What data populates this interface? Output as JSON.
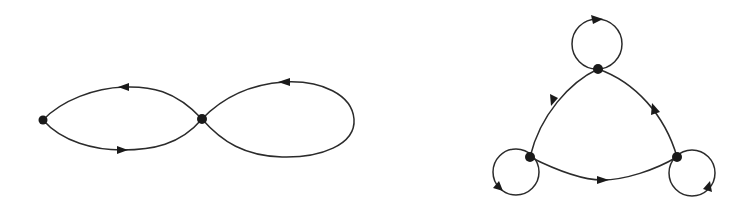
{
  "diagram": {
    "type": "directed-graph-figures",
    "colors": {
      "background": "#ffffff",
      "stroke": "#2b2b2b",
      "node": "#1a1a1a"
    },
    "figures": [
      {
        "name": "figure-eight-graph",
        "nodes": [
          {
            "id": "A",
            "x": 43,
            "y": 120
          },
          {
            "id": "B",
            "x": 202,
            "y": 119
          }
        ],
        "edges": [
          {
            "from": "B",
            "to": "A",
            "kind": "arc-upper"
          },
          {
            "from": "A",
            "to": "B",
            "kind": "arc-lower"
          },
          {
            "from": "B",
            "to": "B",
            "kind": "loop-right"
          }
        ]
      },
      {
        "name": "triangle-graph-with-loops",
        "nodes": [
          {
            "id": "T",
            "x": 598,
            "y": 69
          },
          {
            "id": "L",
            "x": 530,
            "y": 157
          },
          {
            "id": "R",
            "x": 677,
            "y": 157
          }
        ],
        "edges": [
          {
            "from": "T",
            "to": "L",
            "kind": "side-left"
          },
          {
            "from": "L",
            "to": "R",
            "kind": "side-bottom"
          },
          {
            "from": "R",
            "to": "T",
            "kind": "side-right"
          },
          {
            "from": "T",
            "to": "T",
            "kind": "loop-top"
          },
          {
            "from": "L",
            "to": "L",
            "kind": "loop-bottom-left"
          },
          {
            "from": "R",
            "to": "R",
            "kind": "loop-bottom-right"
          }
        ]
      }
    ]
  }
}
